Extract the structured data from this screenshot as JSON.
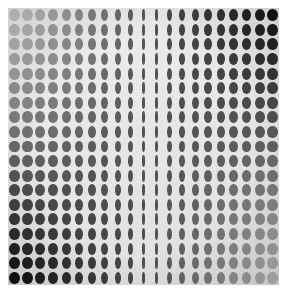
{
  "artwork": {
    "title": "Op Art Dot Grid",
    "style_name": "optical-art-halftone-lattice",
    "medium_note": "printed plate on white paper ground",
    "canvas": {
      "width": 287,
      "height": 296,
      "background_color": "#ffffff"
    },
    "plate": {
      "left": 8,
      "top": 8,
      "width": 271,
      "height": 277,
      "ground_color_light": "#f2f2f0",
      "ground_color_mid": "#ececeb",
      "ground_color_dark": "#e4e4e2",
      "edge_shadow_color": "#d7d7d5"
    },
    "grid": {
      "columns": 21,
      "rows": 19,
      "cell_width": 12.9,
      "cell_height": 14.58,
      "dot_height_ratio": 0.82,
      "max_dot_width_ratio": 0.8,
      "min_dot_width_ratio": 0.11,
      "compression_center_column": 10.6,
      "compression_half_span": 9.2,
      "compression_exponent": 2.1
    },
    "tone": {
      "description": "diagonal tonal gradient: light at top-left and bottom-right, dark at top-right and bottom-left",
      "corner_top_left": "#c9c9c7",
      "corner_top_right": "#131313",
      "corner_bottom_left": "#0f0f0f",
      "corner_bottom_right": "#b4b4b2",
      "center_value": "#4a4a4a",
      "lightest_hex": "#d2d2d0",
      "darkest_hex": "#0b0b0b",
      "center_band_darkening": 0.22
    },
    "effects": {
      "grain_opacity": 0.3,
      "vignette_strength": 0.12,
      "dot_softness_px": 0.45
    }
  }
}
